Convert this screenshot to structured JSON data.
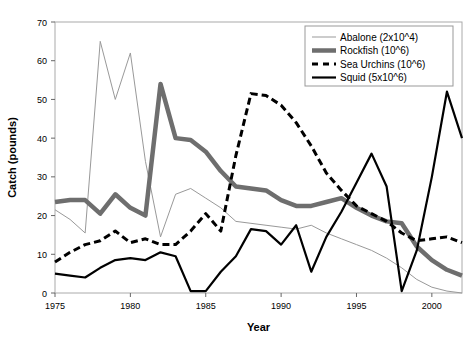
{
  "chart_data": {
    "type": "line",
    "title": "",
    "xlabel": "Year",
    "ylabel": "Catch (pounds)",
    "xlim": [
      1975,
      2002
    ],
    "ylim": [
      0,
      70
    ],
    "ytick_step": 10,
    "xtick_step": 5,
    "xticks": [
      1975,
      1980,
      1985,
      1990,
      1995,
      2000
    ],
    "yticks": [
      0,
      10,
      20,
      30,
      40,
      50,
      60,
      70
    ],
    "grid": false,
    "legend_position": "top-right",
    "x": [
      1975,
      1976,
      1977,
      1978,
      1979,
      1980,
      1981,
      1982,
      1983,
      1984,
      1985,
      1986,
      1987,
      1988,
      1989,
      1990,
      1991,
      1992,
      1993,
      1994,
      1995,
      1996,
      1997,
      1998,
      1999,
      2000,
      2001,
      2002
    ],
    "series": [
      {
        "name": "Abalone (2x10^4)",
        "color": "#999999",
        "width": 1,
        "dash": "none",
        "values": [
          21.5,
          19.0,
          15.5,
          65.0,
          50.0,
          62.0,
          34.0,
          14.5,
          25.5,
          27.0,
          24.5,
          22.0,
          18.5,
          18.0,
          17.5,
          17.0,
          16.5,
          17.5,
          15.5,
          14.0,
          12.5,
          11.0,
          9.0,
          6.5,
          3.5,
          1.5,
          0.5,
          0.0
        ]
      },
      {
        "name": "Rockfish (10^6)",
        "color": "#6e6e6e",
        "width": 4.5,
        "dash": "none",
        "values": [
          23.5,
          24.0,
          24.0,
          20.5,
          25.5,
          22.0,
          20.0,
          54.0,
          40.0,
          39.5,
          36.5,
          31.5,
          27.5,
          27.0,
          26.5,
          24.0,
          22.5,
          22.5,
          23.5,
          24.5,
          22.0,
          20.0,
          18.5,
          18.0,
          12.0,
          8.5,
          6.0,
          4.5
        ]
      },
      {
        "name": "Sea Urchins (10^6)",
        "color": "#000000",
        "width": 3,
        "dash": "7,4",
        "values": [
          8.0,
          10.5,
          12.5,
          13.5,
          16.0,
          13.0,
          14.0,
          12.5,
          12.5,
          16.0,
          20.5,
          16.0,
          35.5,
          51.5,
          51.0,
          48.5,
          44.0,
          38.0,
          31.0,
          26.5,
          22.5,
          20.5,
          18.5,
          15.5,
          13.5,
          14.0,
          14.5,
          13.0
        ]
      },
      {
        "name": "Squid (5x10^6)",
        "color": "#000000",
        "width": 2.2,
        "dash": "none",
        "values": [
          5.0,
          4.5,
          4.0,
          6.5,
          8.5,
          9.0,
          8.5,
          10.5,
          9.5,
          0.5,
          0.5,
          5.5,
          9.5,
          16.5,
          16.0,
          12.5,
          17.5,
          5.5,
          14.5,
          21.0,
          28.5,
          36.0,
          27.5,
          0.5,
          11.0,
          30.0,
          52.0,
          40.0
        ]
      }
    ]
  }
}
